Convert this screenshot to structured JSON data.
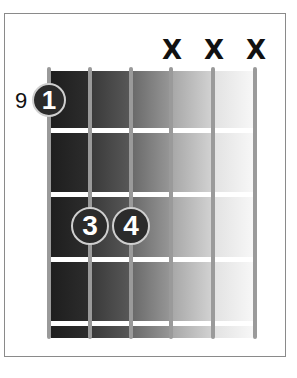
{
  "diagram": {
    "type": "guitar-chord-chart",
    "starting_fret_label": "9",
    "strings": 6,
    "frets_shown": 4,
    "muted_strings": [
      4,
      5,
      6
    ],
    "mute_symbol": "X",
    "fingers": [
      {
        "label": "1",
        "string": 1,
        "fret": 1
      },
      {
        "label": "3",
        "string": 2,
        "fret": 3
      },
      {
        "label": "4",
        "string": 3,
        "fret": 3
      }
    ],
    "colors": {
      "frame": "#8a8a8a",
      "string": "#9a9a9a",
      "fret": "#ffffff",
      "finger_fill": "#2b2b2b",
      "finger_outline": "#cfcfcf",
      "board_dark": "#1e1e1e",
      "board_light": "#f5f5f5"
    }
  },
  "labels": {
    "mute_4": "X",
    "mute_5": "X",
    "mute_6": "X",
    "finger_1": "1",
    "finger_3": "3",
    "finger_4": "4"
  }
}
